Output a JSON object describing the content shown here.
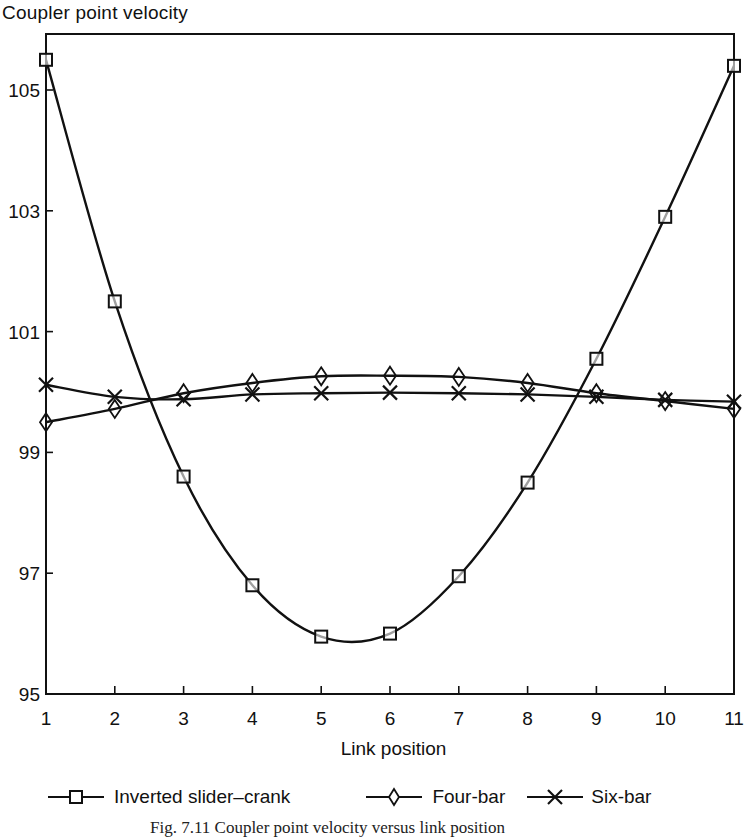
{
  "chart_data": {
    "type": "line",
    "title": "",
    "ylabel": "Coupler point velocity",
    "xlabel": "Link position",
    "x": [
      1,
      2,
      3,
      4,
      5,
      6,
      7,
      8,
      9,
      10,
      11
    ],
    "xticks": [
      "1",
      "2",
      "3",
      "4",
      "5",
      "6",
      "7",
      "8",
      "9",
      "10",
      "11"
    ],
    "yticks": [
      "95",
      "97",
      "99",
      "101",
      "103",
      "105"
    ],
    "ylim": [
      95,
      106
    ],
    "xlim": [
      1,
      11
    ],
    "grid": false,
    "legend_position": "bottom",
    "series": [
      {
        "name": "Inverted slider–crank",
        "marker": "square",
        "values": [
          105.5,
          101.5,
          98.6,
          96.8,
          95.95,
          96.0,
          96.95,
          98.5,
          100.55,
          102.9,
          105.4
        ]
      },
      {
        "name": "Four-bar",
        "marker": "diamond",
        "values": [
          99.5,
          99.72,
          99.98,
          100.15,
          100.26,
          100.27,
          100.25,
          100.15,
          99.98,
          99.85,
          99.72
        ]
      },
      {
        "name": "Six-bar",
        "marker": "x",
        "values": [
          100.12,
          99.92,
          99.88,
          99.96,
          99.98,
          99.99,
          99.98,
          99.96,
          99.92,
          99.87,
          99.84
        ]
      }
    ]
  },
  "axis": {
    "ylabel": "Coupler point velocity",
    "xlabel": "Link position"
  },
  "legend": [
    {
      "label": "Inverted slider–crank",
      "marker": "square-marker-icon"
    },
    {
      "label": "Four-bar",
      "marker": "diamond-marker-icon"
    },
    {
      "label": "Six-bar",
      "marker": "x-marker-icon"
    }
  ],
  "caption": "Fig. 7.11 Coupler point velocity versus link position"
}
